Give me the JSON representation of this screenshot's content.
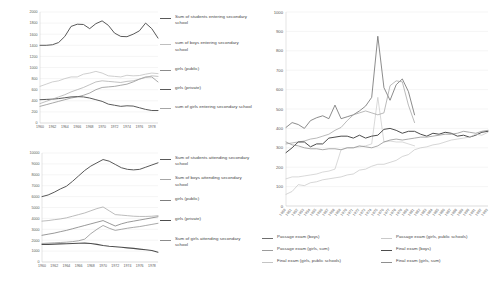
{
  "chart_data": [
    {
      "id": "entering",
      "type": "line",
      "title": "",
      "xlabel": "",
      "ylabel": "",
      "ylim": [
        0,
        2000
      ],
      "yticks": [
        0,
        200,
        400,
        600,
        800,
        1000,
        1200,
        1400,
        1600,
        1800,
        2000
      ],
      "ytick_labels": [
        "0",
        "200",
        "400",
        "600",
        "800",
        "1000",
        "1200",
        "1400",
        "1600",
        "1800",
        "2000"
      ],
      "grid": true,
      "legend_position": "right",
      "categories": [
        1960,
        1961,
        1962,
        1963,
        1964,
        1965,
        1966,
        1967,
        1968,
        1969,
        1970,
        1971,
        1972,
        1973,
        1974,
        1975,
        1976,
        1977,
        1978,
        1979
      ],
      "xtick_labels": [
        "1960",
        "1962",
        "1964",
        "1966",
        "1968",
        "1970",
        "1972",
        "1974",
        "1976",
        "1978"
      ],
      "series": [
        {
          "name": "Sum of students entering secondary school",
          "color": "#595959",
          "width": 1.0,
          "values": [
            1400,
            1400,
            1410,
            1450,
            1560,
            1740,
            1780,
            1775,
            1700,
            1790,
            1840,
            1760,
            1620,
            1560,
            1555,
            1600,
            1660,
            1800,
            1700,
            1530
          ]
        },
        {
          "name": "sum of boys entering secondary school",
          "color": "#bfbfbf",
          "width": 0.75,
          "values": [
            660,
            700,
            740,
            760,
            800,
            830,
            830,
            880,
            900,
            930,
            900,
            850,
            840,
            830,
            860,
            850,
            855,
            880,
            900,
            890
          ]
        },
        {
          "name": "girls (public)",
          "color": "#8c8c8c",
          "width": 0.75,
          "values": [
            300,
            330,
            360,
            390,
            420,
            450,
            470,
            500,
            540,
            600,
            640,
            650,
            660,
            680,
            700,
            740,
            790,
            830,
            830,
            740
          ]
        },
        {
          "name": "girls (private)",
          "color": "#5a5a5a",
          "width": 1.0,
          "values": [
            420,
            425,
            430,
            440,
            455,
            470,
            475,
            470,
            450,
            420,
            390,
            340,
            320,
            300,
            310,
            305,
            275,
            245,
            225,
            225
          ]
        },
        {
          "name": "sum of girls entering secondary school",
          "color": "#a6a6a6",
          "width": 0.7,
          "values": [
            350,
            390,
            430,
            470,
            510,
            560,
            600,
            640,
            690,
            740,
            760,
            750,
            740,
            730,
            750,
            760,
            790,
            820,
            850,
            840
          ]
        }
      ]
    },
    {
      "id": "attending",
      "type": "line",
      "title": "",
      "xlabel": "",
      "ylabel": "",
      "ylim": [
        0,
        10000
      ],
      "yticks": [
        0,
        1000,
        2000,
        3000,
        4000,
        5000,
        6000,
        7000,
        8000,
        9000,
        10000
      ],
      "ytick_labels": [
        "0",
        "1000",
        "2000",
        "3000",
        "4000",
        "5000",
        "6000",
        "7000",
        "8000",
        "9000",
        "10000"
      ],
      "grid": true,
      "legend_position": "right",
      "categories": [
        1960,
        1961,
        1962,
        1963,
        1964,
        1965,
        1966,
        1967,
        1968,
        1969,
        1970,
        1971,
        1972,
        1973,
        1974,
        1975,
        1976,
        1977,
        1978,
        1979
      ],
      "xtick_labels": [
        "1960",
        "1962",
        "1964",
        "1966",
        "1968",
        "1970",
        "1972",
        "1974",
        "1976",
        "1978"
      ],
      "series": [
        {
          "name": "Sum of students attending secondary school",
          "color": "#595959",
          "width": 1.0,
          "values": [
            6000,
            6150,
            6400,
            6700,
            6950,
            7400,
            7900,
            8400,
            8800,
            9100,
            9400,
            9250,
            8950,
            8650,
            8500,
            8450,
            8500,
            8700,
            8900,
            9100
          ]
        },
        {
          "name": "Sum of boys attending secondary school",
          "color": "#a6a6a6",
          "width": 0.75,
          "values": [
            3750,
            3800,
            3880,
            3950,
            4050,
            4200,
            4350,
            4500,
            4700,
            4900,
            5050,
            4700,
            4350,
            4300,
            4250,
            4200,
            4180,
            4180,
            4200,
            4250
          ]
        },
        {
          "name": "girls (public)",
          "color": "#7f7f7f",
          "width": 0.8,
          "values": [
            2450,
            2550,
            2650,
            2780,
            2900,
            3050,
            3200,
            3350,
            3500,
            3650,
            3800,
            3550,
            3300,
            3500,
            3650,
            3750,
            3850,
            3950,
            4050,
            4150
          ]
        },
        {
          "name": "girls (private)",
          "color": "#4d4d4d",
          "width": 1.1,
          "values": [
            1600,
            1620,
            1640,
            1660,
            1680,
            1700,
            1720,
            1730,
            1700,
            1620,
            1520,
            1450,
            1400,
            1350,
            1300,
            1250,
            1180,
            1120,
            1050,
            900
          ]
        },
        {
          "name": "Sum of girls attending secondary school",
          "color": "#8c8c8c",
          "width": 0.75,
          "values": [
            1700,
            1730,
            1760,
            1790,
            1820,
            1870,
            1950,
            2100,
            2600,
            3000,
            3350,
            3100,
            2900,
            3000,
            3100,
            3180,
            3250,
            3350,
            3450,
            3550
          ]
        }
      ]
    },
    {
      "id": "exams",
      "type": "line",
      "title": "",
      "xlabel": "",
      "ylabel": "",
      "ylim": [
        0,
        1000
      ],
      "yticks": [
        0,
        100,
        200,
        300,
        400,
        500,
        600,
        700,
        800,
        900,
        1000
      ],
      "ytick_labels": [
        "0",
        "100",
        "200",
        "300",
        "400",
        "500",
        "600",
        "700",
        "800",
        "900",
        "1000"
      ],
      "grid": true,
      "legend_position": "bottom",
      "categories": [
        "1960",
        "1961",
        "1962",
        "1963",
        "1964",
        "1965",
        "1966",
        "1967",
        "1968",
        "1969",
        "1970",
        "1971",
        "1972",
        "1973",
        "1974",
        "1975",
        "1976",
        "1977",
        "1978",
        "1979",
        "1980",
        "1981",
        "1982",
        "1983",
        "1984",
        "1985",
        "1986",
        "1987",
        "1988",
        "1989",
        "1990",
        "1991",
        "1992",
        "1993"
      ],
      "series": [
        {
          "name": "Passage exam (boys)",
          "color": "#6e6e6e",
          "width": 0.8,
          "values": [
            405,
            430,
            420,
            400,
            440,
            455,
            465,
            450,
            520,
            450,
            460,
            470,
            490,
            515,
            560,
            875,
            610,
            545,
            625,
            655,
            590,
            470,
            null,
            null,
            null,
            null,
            null,
            null,
            null,
            null,
            null,
            null,
            null,
            null
          ]
        },
        {
          "name": "Passage exam (girls, public schools)",
          "color": "#c9c9c9",
          "width": 0.7,
          "values": [
            140,
            150,
            150,
            155,
            160,
            165,
            175,
            180,
            190,
            290,
            300,
            300,
            305,
            310,
            320,
            560,
            330,
            335,
            330,
            330,
            320,
            310,
            null,
            null,
            null,
            null,
            null,
            null,
            null,
            null,
            null,
            null,
            null,
            null
          ]
        },
        {
          "name": "Passage exam (girls, sum)",
          "color": "#9c9c9c",
          "width": 0.7,
          "values": [
            320,
            325,
            330,
            335,
            345,
            350,
            360,
            370,
            390,
            405,
            440,
            470,
            480,
            490,
            480,
            470,
            480,
            620,
            645,
            640,
            520,
            430,
            null,
            null,
            null,
            null,
            null,
            null,
            null,
            null,
            null,
            null,
            null,
            null
          ]
        },
        {
          "name": "Final exam (boys)",
          "color": "#4d4d4d",
          "width": 1.0,
          "values": [
            275,
            300,
            330,
            330,
            305,
            320,
            320,
            350,
            355,
            360,
            360,
            350,
            365,
            350,
            360,
            365,
            395,
            400,
            390,
            375,
            385,
            385,
            370,
            360,
            375,
            370,
            380,
            375,
            360,
            365,
            355,
            365,
            380,
            385
          ]
        },
        {
          "name": "Final exam (girls, public schools)",
          "color": "#c4c4c4",
          "width": 0.7,
          "values": [
            60,
            75,
            110,
            105,
            120,
            125,
            135,
            140,
            145,
            150,
            160,
            165,
            185,
            190,
            205,
            215,
            215,
            225,
            235,
            255,
            265,
            290,
            300,
            305,
            315,
            320,
            330,
            340,
            345,
            350,
            355,
            370,
            365,
            380
          ]
        },
        {
          "name": "Final exam (girls, sum)",
          "color": "#8f8f8f",
          "width": 0.75,
          "values": [
            330,
            315,
            310,
            300,
            295,
            295,
            290,
            295,
            295,
            290,
            300,
            300,
            310,
            305,
            300,
            310,
            330,
            340,
            345,
            340,
            345,
            350,
            355,
            355,
            360,
            365,
            370,
            370,
            375,
            385,
            380,
            375,
            385,
            390
          ]
        }
      ]
    }
  ],
  "panels": {
    "entering": {
      "legend": [
        {
          "label": "Sum of students entering secondary school",
          "color": "#595959",
          "width": 1.2
        },
        {
          "label": "sum of boys entering secondary school",
          "color": "#bfbfbf",
          "width": 0.9
        },
        {
          "label": "girls (public)",
          "color": "#8c8c8c",
          "width": 0.9
        },
        {
          "label": "girls (private)",
          "color": "#5a5a5a",
          "width": 1.4
        },
        {
          "label": "sum of girls entering secondary school",
          "color": "#a6a6a6",
          "width": 0.8
        }
      ]
    },
    "attending": {
      "legend": [
        {
          "label": "Sum of students attending secondary school",
          "color": "#595959",
          "width": 1.2
        },
        {
          "label": "Sum of boys attending secondary school",
          "color": "#a6a6a6",
          "width": 0.9
        },
        {
          "label": "girls (public)",
          "color": "#7f7f7f",
          "width": 0.9
        },
        {
          "label": "girls (private)",
          "color": "#4d4d4d",
          "width": 1.4
        },
        {
          "label": "Sum of girls attending secondary school",
          "color": "#8c8c8c",
          "width": 0.8
        }
      ]
    },
    "exams": {
      "legend": [
        {
          "label": "Passage exam (boys)",
          "color": "#6e6e6e",
          "width": 1.1
        },
        {
          "label": "Passage exam (girls, public schools)",
          "color": "#c9c9c9",
          "width": 0.8
        },
        {
          "label": "Passage exam (girls, sum)",
          "color": "#9c9c9c",
          "width": 0.8
        },
        {
          "label": "Final exam (boys)",
          "color": "#4d4d4d",
          "width": 1.3
        },
        {
          "label": "Final exam (girls, public schools)",
          "color": "#c4c4c4",
          "width": 0.8
        },
        {
          "label": "Final exam (girls, sum)",
          "color": "#8f8f8f",
          "width": 0.9
        }
      ]
    }
  }
}
